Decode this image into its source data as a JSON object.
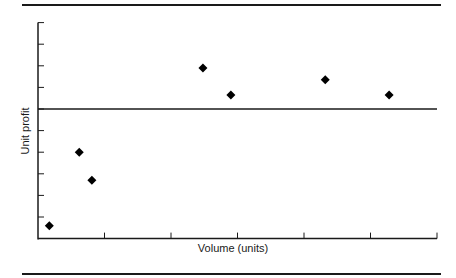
{
  "chart_data": {
    "type": "scatter",
    "title": "",
    "xlabel": "Volume (units)",
    "ylabel": "Unit profit",
    "x_ticks": 6,
    "y_ticks_above_zero": 4,
    "y_ticks_below_zero": 6,
    "xlim": [
      0,
      6
    ],
    "ylim": [
      -6,
      4
    ],
    "zero_line": true,
    "grid": false,
    "legend": null,
    "tick_labels_visible": false,
    "points": [
      {
        "x": 0.17,
        "y": -5.4
      },
      {
        "x": 0.62,
        "y": -2.0
      },
      {
        "x": 0.81,
        "y": -3.3
      },
      {
        "x": 2.48,
        "y": 1.9
      },
      {
        "x": 2.9,
        "y": 0.65
      },
      {
        "x": 4.32,
        "y": 1.35
      },
      {
        "x": 5.28,
        "y": 0.65
      }
    ],
    "marker": "diamond",
    "marker_color": "#000000"
  },
  "colors": {
    "ink": "#1a1a1a",
    "background": "#ffffff"
  }
}
